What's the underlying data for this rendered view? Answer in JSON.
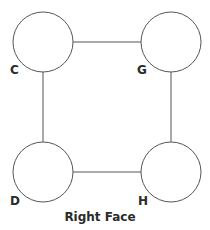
{
  "diagram": {
    "title": "Right Face",
    "stroke_color": "#555555",
    "nodes": [
      {
        "id": "C",
        "label": "C",
        "cx": 43,
        "cy": 42,
        "r": 30
      },
      {
        "id": "G",
        "label": "G",
        "cx": 171,
        "cy": 42,
        "r": 30
      },
      {
        "id": "D",
        "label": "D",
        "cx": 43,
        "cy": 172,
        "r": 30
      },
      {
        "id": "H",
        "label": "H",
        "cx": 171,
        "cy": 172,
        "r": 30
      }
    ],
    "edges": [
      {
        "from": "C",
        "to": "G"
      },
      {
        "from": "C",
        "to": "D"
      },
      {
        "from": "G",
        "to": "H"
      },
      {
        "from": "D",
        "to": "H"
      }
    ]
  }
}
